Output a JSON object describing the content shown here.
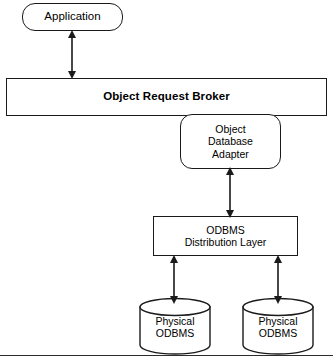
{
  "diagram": {
    "nodes": {
      "application": {
        "label": "Application",
        "shape": "rounded-rectangle"
      },
      "object_request_broker": {
        "label": "Object Request Broker",
        "shape": "rectangle"
      },
      "object_database_adapter": {
        "label": "Object\nDatabase\nAdapter",
        "shape": "rounded-rectangle"
      },
      "odbms_distribution_layer": {
        "label": "ODBMS\nDistribution Layer",
        "shape": "rectangle"
      },
      "physical_odbms_left": {
        "label": "Physical\nODBMS",
        "shape": "cylinder"
      },
      "physical_odbms_right": {
        "label": "Physical\nODBMS",
        "shape": "cylinder"
      }
    },
    "connections": [
      {
        "from": "application",
        "to": "object_request_broker",
        "style": "double-headed-arrow"
      },
      {
        "from": "object_database_adapter",
        "to": "odbms_distribution_layer",
        "style": "double-headed-arrow"
      },
      {
        "from": "odbms_distribution_layer",
        "to": "physical_odbms_left",
        "style": "double-headed-arrow"
      },
      {
        "from": "odbms_distribution_layer",
        "to": "physical_odbms_right",
        "style": "double-headed-arrow"
      }
    ],
    "colors": {
      "stroke": "#1a1a1a",
      "fill": "#ffffff",
      "background": "#ffffff"
    }
  }
}
